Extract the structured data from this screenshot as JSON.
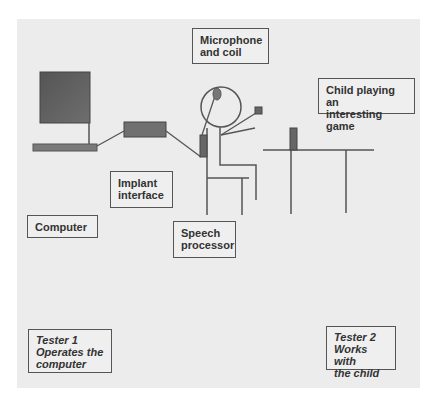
{
  "diagram": {
    "type": "cochlear implant testing setup",
    "labels": {
      "microphone": "Microphone\nand coil",
      "child": "Child playing an\ninteresting game",
      "implant_interface": "Implant\ninterface",
      "computer": "Computer",
      "speech_processor": "Speech\nprocessor",
      "tester1": "Tester 1\nOperates the\ncomputer",
      "tester2": "Tester 2\nWorks with\nthe child"
    },
    "colors": {
      "background": "#ececec",
      "device_fill": "#666666",
      "line": "#555555"
    }
  }
}
